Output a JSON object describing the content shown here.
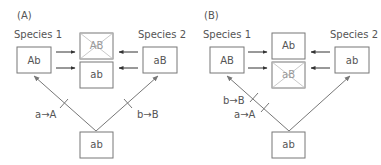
{
  "panels": [
    {
      "id": "A",
      "label": "(A)",
      "species1": {
        "label": "Species 1",
        "genotype": "Ab"
      },
      "species2": {
        "label": "Species 2",
        "genotype": "aB"
      },
      "hybrids": [
        {
          "genotype": "AB",
          "crossed_out": true
        },
        {
          "genotype": "ab",
          "crossed_out": false
        }
      ],
      "ancestor": {
        "genotype": "ab"
      },
      "mutations": [
        {
          "text": "a→A",
          "lineage": "species1"
        },
        {
          "text": "b→B",
          "lineage": "species2"
        }
      ]
    },
    {
      "id": "B",
      "label": "(B)",
      "species1": {
        "label": "Species 1",
        "genotype": "AB"
      },
      "species2": {
        "label": "Species 2",
        "genotype": "ab"
      },
      "hybrids": [
        {
          "genotype": "Ab",
          "crossed_out": false
        },
        {
          "genotype": "aB",
          "crossed_out": true
        }
      ],
      "ancestor": {
        "genotype": "ab"
      },
      "mutations": [
        {
          "text": "b→B",
          "lineage": "species1"
        },
        {
          "text": "a→A",
          "lineage": "species1"
        }
      ]
    }
  ]
}
